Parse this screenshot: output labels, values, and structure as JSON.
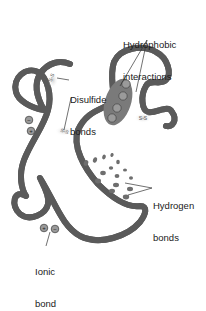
{
  "labels": {
    "hydrophobic": {
      "line1": "Hydrophobic",
      "line2": "interactions"
    },
    "disulfide": {
      "line1": "Disulfide",
      "line2": "bonds"
    },
    "hydrogen": {
      "line1": "Hydrogen",
      "line2": "bonds"
    },
    "ionic": {
      "line1": "Ionic",
      "line2": "bond"
    }
  },
  "glyphs": {
    "ss": "S-S",
    "minus": "−",
    "plus": "+"
  },
  "colors": {
    "strand_outer": "#5a5a5a",
    "strand_inner": "#a8a8a8",
    "hydrophobic_core": "#7a7a7a",
    "dots": "#6e6e6e",
    "halo": "#d9d9d9",
    "text": "#1a1a1a"
  }
}
